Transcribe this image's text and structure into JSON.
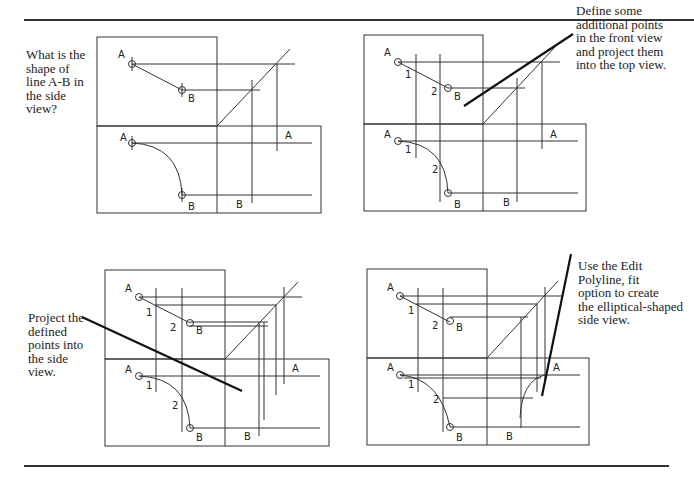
{
  "panels": [
    {
      "id": "p1",
      "caption": "What is the\nshape of\nline A-B in\nthe side\nview?",
      "labels": {
        "a": "A",
        "b": "B",
        "a_side": "A",
        "b_side": "B"
      }
    },
    {
      "id": "p2",
      "caption": "Define some\nadditional points\nin the front view\nand project them\ninto the top view.",
      "labels": {
        "a": "A",
        "b": "B",
        "p1": "1",
        "p2": "2",
        "a_side": "A",
        "b_side": "B"
      }
    },
    {
      "id": "p3",
      "caption": "Project the\ndefined\npoints into\nthe side\nview.",
      "labels": {
        "a": "A",
        "b": "B",
        "p1": "1",
        "p2": "2",
        "a_side": "A",
        "b_side": "B"
      }
    },
    {
      "id": "p4",
      "caption": "Use the Edit\nPolyline, fit\noption to create\nthe elliptical-shaped\nside view.",
      "labels": {
        "a": "A",
        "b": "B",
        "p1": "1",
        "p2": "2",
        "a_side": "A",
        "b_side": "B"
      }
    }
  ],
  "colors": {
    "line": "#333333",
    "text": "#222222",
    "background": "#ffffff"
  }
}
